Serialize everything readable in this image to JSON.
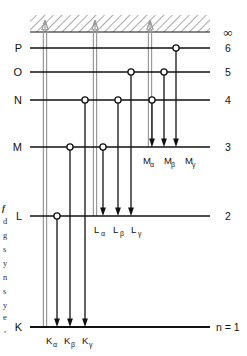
{
  "figure": {
    "colors": {
      "level_line": "#111111",
      "transition_arrow": "#111111",
      "ionization_arrow": "#9a9a9a",
      "hatch": "#555555",
      "vacancy_circle_fill": "#ffffff",
      "background": "#ffffff"
    },
    "geometry": {
      "level_x_start": 30,
      "level_x_end": 210,
      "hatch_top": 15,
      "hatch_bottom": 32
    },
    "continuum": {
      "right_label": "∞",
      "hatched": true
    },
    "levels": [
      {
        "shell": "P",
        "n": "6",
        "y": 48,
        "right_label": "6",
        "circles_x": [
          176
        ]
      },
      {
        "shell": "O",
        "n": "5",
        "y": 72,
        "right_label": "5",
        "circles_x": [
          131,
          164
        ]
      },
      {
        "shell": "N",
        "n": "4",
        "y": 100,
        "right_label": "4",
        "circles_x": [
          85,
          118,
          152
        ]
      },
      {
        "shell": "M",
        "n": "3",
        "y": 147,
        "right_label": "3",
        "circles_x": [
          70,
          103
        ]
      },
      {
        "shell": "L",
        "n": "2",
        "y": 216,
        "right_label": "2",
        "circles_x": [
          57
        ]
      },
      {
        "shell": "K",
        "n": "1",
        "y": 327,
        "right_label": "n = 1",
        "circles_x": []
      }
    ],
    "ionization_arrows": [
      {
        "x": 45,
        "from_y": 327,
        "to_y": 20
      },
      {
        "x": 95,
        "from_y": 216,
        "to_y": 20
      },
      {
        "x": 150,
        "from_y": 147,
        "to_y": 20
      }
    ],
    "transitions": [
      {
        "x": 57,
        "from_y": 216,
        "to_y": 327,
        "series": "K",
        "greek": "α",
        "label": "Kα",
        "label_x": 57,
        "label_y": 344
      },
      {
        "x": 70,
        "from_y": 147,
        "to_y": 327,
        "series": "K",
        "greek": "β",
        "label": "Kβ",
        "label_x": 72,
        "label_y": 344
      },
      {
        "x": 85,
        "from_y": 100,
        "to_y": 327,
        "series": "K",
        "greek": "γ",
        "label": "Kγ",
        "label_x": 89,
        "label_y": 344
      },
      {
        "x": 103,
        "from_y": 147,
        "to_y": 216,
        "series": "L",
        "greek": "α",
        "label": "Lα",
        "label_x": 103,
        "label_y": 233
      },
      {
        "x": 118,
        "from_y": 100,
        "to_y": 216,
        "series": "L",
        "greek": "β",
        "label": "Lβ",
        "label_x": 120,
        "label_y": 233
      },
      {
        "x": 131,
        "from_y": 72,
        "to_y": 216,
        "series": "L",
        "greek": "γ",
        "label": "Lγ",
        "label_x": 137,
        "label_y": 233
      },
      {
        "x": 152,
        "from_y": 100,
        "to_y": 147,
        "series": "M",
        "greek": "α",
        "label": "Mα",
        "label_x": 152,
        "label_y": 164
      },
      {
        "x": 164,
        "from_y": 72,
        "to_y": 147,
        "series": "M",
        "greek": "β",
        "label": "Mβ",
        "label_x": 170,
        "label_y": 164
      },
      {
        "x": 176,
        "from_y": 48,
        "to_y": 147,
        "series": "M",
        "greek": "γ",
        "label": "Mγ",
        "label_x": 188,
        "label_y": 164
      }
    ],
    "series_labels": [
      {
        "id": "k-alpha",
        "base": "K",
        "sub": "α",
        "x": 46,
        "y": 344
      },
      {
        "id": "k-beta",
        "base": "K",
        "sub": "β",
        "x": 64,
        "y": 344
      },
      {
        "id": "k-gamma",
        "base": "K",
        "sub": "γ",
        "x": 82,
        "y": 344
      },
      {
        "id": "l-alpha",
        "base": "L",
        "sub": "α",
        "x": 94,
        "y": 233
      },
      {
        "id": "l-beta",
        "base": "L",
        "sub": "β",
        "x": 113,
        "y": 233
      },
      {
        "id": "l-gamma",
        "base": "L",
        "sub": "γ",
        "x": 131,
        "y": 233
      },
      {
        "id": "m-alpha",
        "base": "M",
        "sub": "α",
        "x": 143,
        "y": 164
      },
      {
        "id": "m-beta",
        "base": "M",
        "sub": "β",
        "x": 164,
        "y": 164
      },
      {
        "id": "m-gamma",
        "base": "M",
        "sub": "γ",
        "x": 185,
        "y": 164
      }
    ],
    "margin_fragments": [
      {
        "text": "f",
        "x": 2,
        "y": 211,
        "italic": true
      },
      {
        "text": "d",
        "x": 3,
        "y": 224,
        "italic": false
      },
      {
        "text": "g",
        "x": 3,
        "y": 238,
        "italic": false
      },
      {
        "text": "s",
        "x": 3,
        "y": 252,
        "italic": false
      },
      {
        "text": "y",
        "x": 3,
        "y": 266,
        "italic": false
      },
      {
        "text": "n",
        "x": 3,
        "y": 280,
        "italic": false
      },
      {
        "text": "s",
        "x": 3,
        "y": 294,
        "italic": false
      },
      {
        "text": "y",
        "x": 3,
        "y": 308,
        "italic": false
      },
      {
        "text": "e",
        "x": 3,
        "y": 320,
        "italic": false
      },
      {
        "text": ",",
        "x": 4,
        "y": 332,
        "italic": false
      }
    ]
  }
}
